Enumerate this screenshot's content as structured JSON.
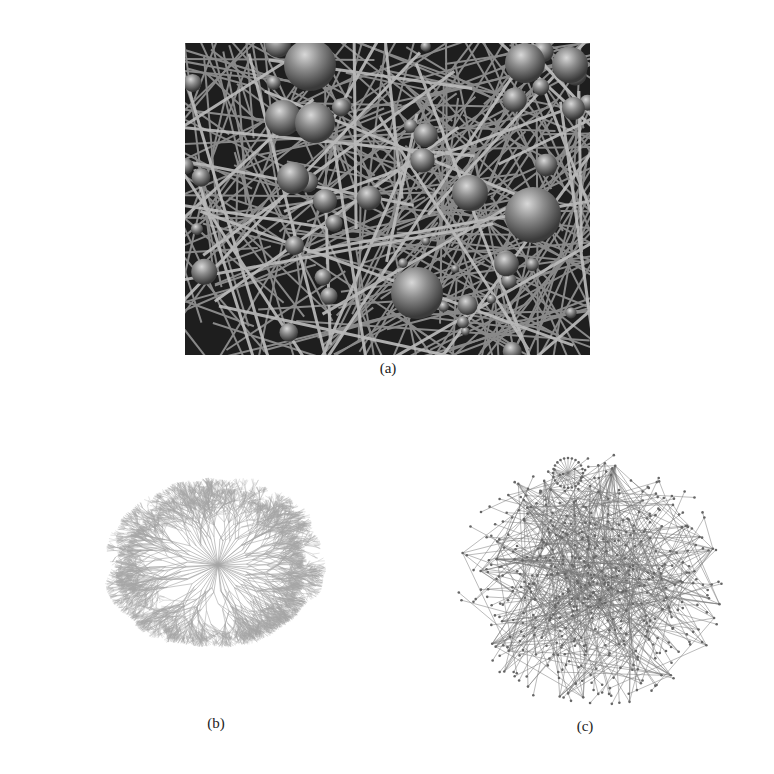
{
  "figure": {
    "panels": [
      {
        "id": "a",
        "caption": "(a)",
        "description": "3D rendered network with shaded spheres (nodes) and cylindrical rods (edges), grayscale"
      },
      {
        "id": "b",
        "caption": "(b)",
        "description": "Dense radial tree-like network layout, light gray branching structure"
      },
      {
        "id": "c",
        "caption": "(c)",
        "description": "Force-directed node-link network graph with small circular nodes and thin edges"
      }
    ]
  },
  "colors": {
    "background": "#ffffff",
    "panel_a_bg": "#2a2a2a",
    "sphere": "#8a8a8a",
    "rod": "#9a9a9a",
    "tree": "#a8a8a8",
    "graph": "#555555"
  }
}
